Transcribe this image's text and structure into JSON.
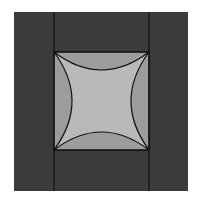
{
  "canvas": {
    "width": 199,
    "height": 202,
    "background": "#ffffff"
  },
  "colors": {
    "outer": "#3b3b3b",
    "lens": "#9c9c9c",
    "center": "#b9b9b9",
    "stroke": "#111111"
  },
  "outer_square": {
    "x": 14,
    "y": 12,
    "w": 174,
    "h": 179
  },
  "inner_square": {
    "x1": 54,
    "y1": 52,
    "x2": 149,
    "y2": 150
  },
  "arc_depth": 18
}
